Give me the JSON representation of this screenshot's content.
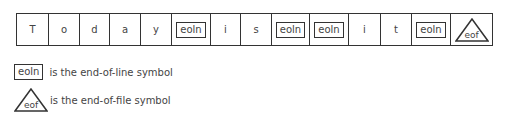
{
  "diagram": {
    "cells": [
      {
        "type": "char",
        "text": "T",
        "width": 32
      },
      {
        "type": "char",
        "text": "o",
        "width": 31
      },
      {
        "type": "char",
        "text": "d",
        "width": 30
      },
      {
        "type": "char",
        "text": "a",
        "width": 31
      },
      {
        "type": "char",
        "text": "y",
        "width": 31
      },
      {
        "type": "eoln",
        "text": "eoln",
        "width": 39
      },
      {
        "type": "char",
        "text": "i",
        "width": 30
      },
      {
        "type": "char",
        "text": "s",
        "width": 31
      },
      {
        "type": "eoln",
        "text": "eoln",
        "width": 38
      },
      {
        "type": "eoln",
        "text": "eoln",
        "width": 39
      },
      {
        "type": "char",
        "text": "i",
        "width": 32
      },
      {
        "type": "char",
        "text": "t",
        "width": 31
      },
      {
        "type": "eoln",
        "text": "eoln",
        "width": 39
      },
      {
        "type": "eof",
        "text": "eof",
        "width": 42
      }
    ],
    "legend": {
      "eoln_symbol": "eoln",
      "eoln_label": "is the end-of-line symbol",
      "eof_symbol": "eof",
      "eof_label": "is the end-of-file symbol"
    }
  }
}
